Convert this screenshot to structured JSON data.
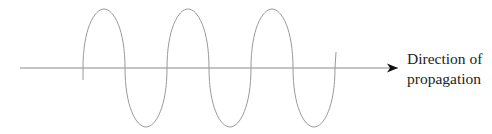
{
  "diagram": {
    "axis": {
      "x_start": 20,
      "x_end": 398,
      "y": 68,
      "color": "#8a8a8a",
      "arrowhead_color": "#111111"
    },
    "wave": {
      "type": "sine",
      "x_start": 83,
      "x_end": 336,
      "start_y": 80,
      "end_y": 52,
      "crest_y": 9,
      "trough_y": 127,
      "crests_x": [
        104,
        188,
        272
      ],
      "troughs_x": [
        146,
        230,
        314
      ],
      "axis_crossings_x": [
        83,
        125,
        167,
        209,
        251,
        293,
        335
      ],
      "wavelength_px": 84,
      "color": "#9a9a9a"
    },
    "label": {
      "line1": "Direction of",
      "line2": "propagation"
    }
  }
}
